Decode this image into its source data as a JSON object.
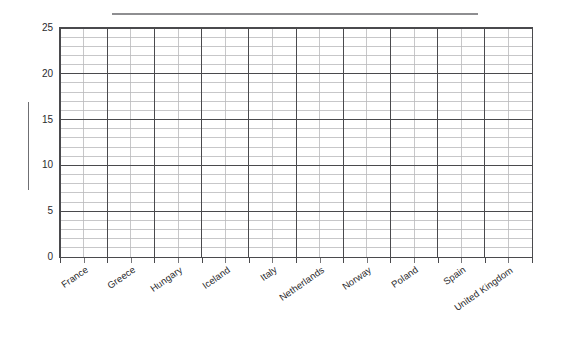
{
  "chart_data": {
    "type": "bar",
    "title": "",
    "subtitle": "",
    "xlabel": "",
    "ylabel": "",
    "categories": [
      "France",
      "Greece",
      "Hungary",
      "Iceland",
      "Italy",
      "Netherlands",
      "Norway",
      "Poland",
      "Spain",
      "United Kingdom"
    ],
    "values": [
      null,
      null,
      null,
      null,
      null,
      null,
      null,
      null,
      null,
      null
    ],
    "series": [],
    "ylim": [
      0,
      25
    ],
    "ytick_labels": [
      "0",
      "5",
      "10",
      "15",
      "20",
      "25"
    ],
    "ytick_values": [
      0,
      5,
      10,
      15,
      20,
      25
    ],
    "y_minor_step": 1,
    "y_major_step": 5,
    "x_cells_per_category": 2,
    "grid": "both",
    "grid_minor_color": "#b9b9bc",
    "grid_major_color": "#4a4a4d",
    "axis_color": "#4a4a4d",
    "plot_background": "#ffffff",
    "legend_position": "top",
    "legend_entries": [],
    "annotations": [
      {
        "name": "top-rule",
        "color": "#8e8e91"
      },
      {
        "name": "axis-title-rule",
        "color": "#6f6f73"
      }
    ]
  },
  "axes": {
    "y": {
      "labels": [
        "25",
        "20",
        "15",
        "10",
        "5",
        "0"
      ]
    },
    "x": {
      "labels": [
        "France",
        "Greece",
        "Hungary",
        "Iceland",
        "Italy",
        "Netherlands",
        "Norway",
        "Poland",
        "Spain",
        "United Kingdom"
      ]
    }
  }
}
